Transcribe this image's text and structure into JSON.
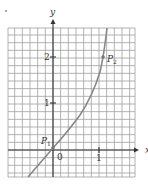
{
  "figure": {
    "axes": {
      "x_label": "x",
      "y_label": "y",
      "x_ticks": [
        {
          "value": 1,
          "label": "1"
        }
      ],
      "y_ticks": [
        {
          "value": 1,
          "label": "1"
        },
        {
          "value": 2,
          "label": "2"
        }
      ],
      "origin_label": "0"
    },
    "points": [
      {
        "name": "P",
        "subscript": "1",
        "x": 0,
        "y": 0
      },
      {
        "name": "P",
        "subscript": "2",
        "x": 1.0,
        "y": 2.0
      }
    ],
    "grid": {
      "cells_per_unit": 6,
      "x_range": [
        -1,
        1.8
      ],
      "y_range": [
        -0.6,
        2.65
      ]
    },
    "colors": {
      "grid": "#9a9a9a",
      "axis": "#333333",
      "curve": "#888888",
      "text": "#333333"
    }
  }
}
